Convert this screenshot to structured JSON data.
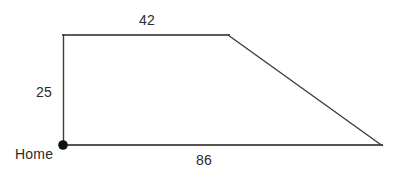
{
  "figure": {
    "kind": "right-trapezoid-diagram",
    "background_color": "#ffffff",
    "stroke_color": "#555555",
    "stroke_color_dark": "#3d3d3d",
    "text_color": "#2b2b2b",
    "vertex_marker_color": "#111111",
    "labels": {
      "top_side": "42",
      "left_side": "25",
      "bottom_side": "86",
      "origin_point": "Home"
    },
    "vertices": {
      "home": {
        "x": 63,
        "y": 145
      },
      "top_left": {
        "x": 63,
        "y": 35
      },
      "top_right": {
        "x": 228,
        "y": 35
      },
      "bottom_right": {
        "x": 382,
        "y": 145
      }
    },
    "segments": [
      {
        "name": "left-vertical",
        "label": "25",
        "from": "home",
        "to": "top_left"
      },
      {
        "name": "top-horizontal",
        "label": "42",
        "from": "top_left",
        "to": "top_right"
      },
      {
        "name": "slanted-hypotenuse",
        "label": "",
        "from": "top_right",
        "to": "bottom_right"
      },
      {
        "name": "bottom-horizontal",
        "label": "86",
        "from": "home",
        "to": "bottom_right"
      }
    ]
  }
}
